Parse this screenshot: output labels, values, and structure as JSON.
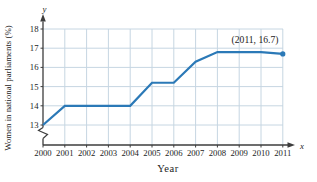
{
  "chart_data": {
    "type": "line",
    "title": "",
    "xlabel": "Year",
    "ylabel": "Women in national parliaments (%)",
    "x": [
      2000,
      2001,
      2002,
      2003,
      2004,
      2005,
      2006,
      2007,
      2008,
      2009,
      2010,
      2011
    ],
    "values": [
      13,
      14,
      14,
      14,
      14,
      15.2,
      15.2,
      16.3,
      16.8,
      16.8,
      16.8,
      16.7
    ],
    "x_ticks": [
      "2000",
      "2001",
      "2002",
      "2003",
      "2004",
      "2005",
      "2006",
      "2007",
      "2008",
      "2009",
      "2010",
      "2011"
    ],
    "y_ticks": [
      13,
      14,
      15,
      16,
      17,
      18
    ],
    "ylim": [
      13,
      18
    ],
    "y_axis_break": true,
    "grid": true,
    "legend": "none",
    "annotation": {
      "text": "(2011, 16.7)",
      "x": 2011,
      "y": 16.7
    },
    "axis_letter_x": "x",
    "axis_letter_y": "y",
    "line_color": "#2b79b7",
    "grid_color": "#c6d6e2",
    "axis_color": "#3d3d3d",
    "text_color": "#1c1c1c",
    "marker": {
      "shape": "circle",
      "at": "last-point"
    }
  }
}
